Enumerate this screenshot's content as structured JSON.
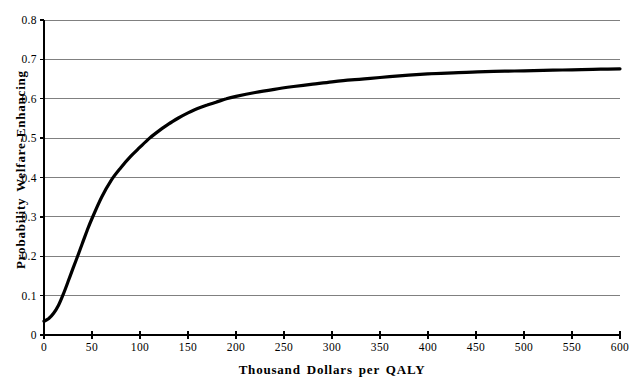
{
  "chart_data": {
    "type": "line",
    "title": "",
    "xlabel": "Thousand Dollars per QALY",
    "ylabel": "Probability Welfare-Enhancing",
    "xlim": [
      0,
      600
    ],
    "ylim": [
      0,
      0.8
    ],
    "x_ticks": [
      0,
      50,
      100,
      150,
      200,
      250,
      300,
      350,
      400,
      450,
      500,
      550,
      600
    ],
    "x_tick_labels": [
      "0",
      "50",
      "100",
      "150",
      "200",
      "250",
      "300",
      "350",
      "400",
      "450",
      "500",
      "550",
      "600"
    ],
    "y_ticks": [
      0,
      0.1,
      0.2,
      0.3,
      0.4,
      0.5,
      0.6,
      0.7,
      0.8
    ],
    "y_tick_labels": [
      "0",
      "0.1",
      "0.2",
      "0.3",
      "0.4",
      "0.5",
      "0.6",
      "0.7",
      "0.8"
    ],
    "grid": "horizontal-only",
    "legend": "none",
    "colors": {
      "line": "#000000",
      "grid": "#808080",
      "axis": "#000000",
      "background": "#ffffff",
      "text": "#000000"
    },
    "series": [
      {
        "name": "Probability Welfare-Enhancing",
        "x": [
          0,
          5,
          10,
          15,
          20,
          25,
          30,
          35,
          40,
          45,
          50,
          60,
          70,
          80,
          90,
          100,
          110,
          120,
          130,
          140,
          150,
          160,
          170,
          180,
          190,
          200,
          220,
          240,
          260,
          280,
          300,
          320,
          340,
          360,
          380,
          400,
          420,
          440,
          460,
          480,
          500,
          520,
          540,
          560,
          580,
          600
        ],
        "y": [
          0.035,
          0.042,
          0.055,
          0.075,
          0.103,
          0.135,
          0.168,
          0.2,
          0.233,
          0.266,
          0.296,
          0.35,
          0.393,
          0.425,
          0.453,
          0.477,
          0.5,
          0.519,
          0.536,
          0.551,
          0.564,
          0.575,
          0.584,
          0.592,
          0.6,
          0.606,
          0.616,
          0.624,
          0.631,
          0.637,
          0.643,
          0.648,
          0.652,
          0.656,
          0.66,
          0.663,
          0.665,
          0.667,
          0.669,
          0.67,
          0.671,
          0.672,
          0.673,
          0.674,
          0.675,
          0.676
        ]
      }
    ]
  }
}
